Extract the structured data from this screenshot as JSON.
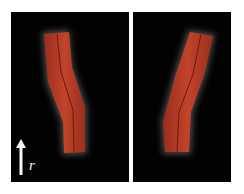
{
  "figure": {
    "panels": [
      {
        "id": "left",
        "description": "Red rod-like structure, bending to the right lower half",
        "fill_color": "#b53a22",
        "glow_color": "#8a8a8a"
      },
      {
        "id": "right",
        "description": "Red rod-like structure, tilted with upper part to the right",
        "fill_color": "#b53a22",
        "glow_color": "#8a8a8a"
      }
    ],
    "axis": {
      "arrow": "up-arrow",
      "label": "r"
    },
    "background": "#020202"
  }
}
